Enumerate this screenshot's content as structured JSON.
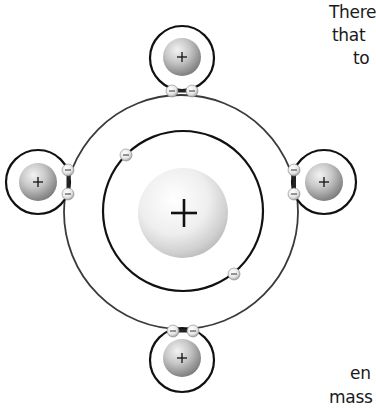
{
  "diagram": {
    "central_atom": {
      "nucleus": {
        "cx": 181,
        "cy": 212,
        "r": 45,
        "symbol": "+"
      },
      "inner_orbit": {
        "cx": 183,
        "cy": 211,
        "r": 80
      },
      "outer_orbit": {
        "cx": 181,
        "cy": 212,
        "r": 117
      },
      "inner_electrons": [
        {
          "cx": 126,
          "cy": 155,
          "symbol": "−"
        },
        {
          "cx": 234,
          "cy": 274,
          "symbol": "−"
        }
      ]
    },
    "satellite_atoms": [
      {
        "position": "top",
        "cx": 182,
        "cy": 58,
        "orbit_r": 32,
        "nucleus_r": 19,
        "symbol": "+",
        "shared_electrons": [
          {
            "cx": 172,
            "cy": 91,
            "symbol": "−"
          },
          {
            "cx": 192,
            "cy": 91,
            "symbol": "−"
          }
        ]
      },
      {
        "position": "left",
        "cx": 38,
        "cy": 182,
        "orbit_r": 32,
        "nucleus_r": 19,
        "symbol": "+",
        "shared_electrons": [
          {
            "cx": 68,
            "cy": 170,
            "symbol": "−"
          },
          {
            "cx": 68,
            "cy": 194,
            "symbol": "−"
          }
        ]
      },
      {
        "position": "right",
        "cx": 323,
        "cy": 182,
        "orbit_r": 32,
        "nucleus_r": 19,
        "symbol": "+",
        "shared_electrons": [
          {
            "cx": 294,
            "cy": 170,
            "symbol": "−"
          },
          {
            "cx": 294,
            "cy": 194,
            "symbol": "−"
          }
        ]
      },
      {
        "position": "bottom",
        "cx": 182,
        "cy": 357,
        "orbit_r": 32,
        "nucleus_r": 19,
        "symbol": "+",
        "shared_electrons": [
          {
            "cx": 173,
            "cy": 331,
            "symbol": "−"
          },
          {
            "cx": 193,
            "cy": 331,
            "symbol": "−"
          }
        ]
      }
    ]
  },
  "text_fragments": {
    "line1": "There",
    "line2": "that",
    "line3": "to",
    "line4": "en",
    "line5": "mass"
  },
  "colors": {
    "orbit_stroke": "#1a1a1a",
    "outer_orbit_stroke": "#3a3a3a",
    "nucleus_light": "#f4f4f4",
    "nucleus_dark": "#9a9a9a",
    "text": "#1a1a1a"
  }
}
